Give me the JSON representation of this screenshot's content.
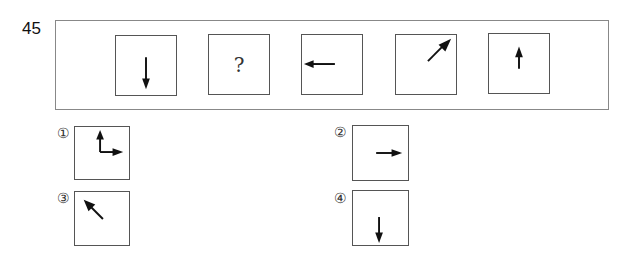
{
  "question": {
    "number": "45",
    "sequence": [
      {
        "type": "arrow",
        "direction": "down"
      },
      {
        "type": "unknown",
        "label": "?"
      },
      {
        "type": "arrow",
        "direction": "left"
      },
      {
        "type": "arrow",
        "direction": "up-right"
      },
      {
        "type": "arrow",
        "direction": "up"
      }
    ]
  },
  "options": [
    {
      "label": "①",
      "content": "up and right arrows joined at corner"
    },
    {
      "label": "②",
      "content": "right arrow"
    },
    {
      "label": "③",
      "content": "up-left arrow"
    },
    {
      "label": "④",
      "content": "down arrow"
    }
  ]
}
